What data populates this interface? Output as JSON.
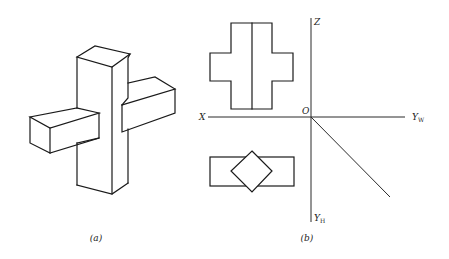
{
  "figure_a": {
    "caption": "(a)",
    "description": "Isometric view of cross-shaped solid: vertical square post with horizontal rectangular bar passing through"
  },
  "figure_b": {
    "caption": "(b)",
    "axes": {
      "x_label": "X",
      "z_label": "Z",
      "origin_label": "O",
      "yw_label": "Y",
      "yw_sub": "W",
      "yh_label": "Y",
      "yh_sub": "H"
    },
    "views": {
      "front_view": "cross outline with center vertical line",
      "top_view": "rectangle with overlapping diamond (rotated square)"
    }
  }
}
